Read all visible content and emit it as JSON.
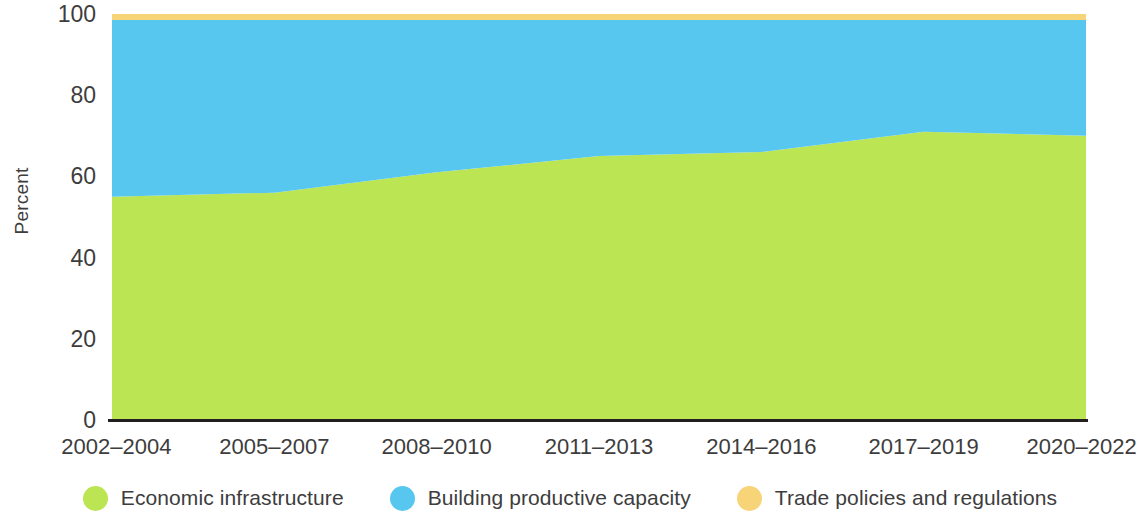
{
  "chart_data": {
    "type": "area",
    "stacked": true,
    "normalized_percent": true,
    "title": "",
    "subtitle": "",
    "xlabel": "",
    "ylabel": "Percent",
    "ylim": [
      0,
      100
    ],
    "yticks": [
      0,
      20,
      40,
      60,
      80,
      100
    ],
    "grid": false,
    "legend_position": "bottom",
    "categories": [
      "2002–2004",
      "2005–2007",
      "2008–2010",
      "2011–2013",
      "2014–2016",
      "2017–2019",
      "2020–2022"
    ],
    "series": [
      {
        "name": "Economic infrastructure",
        "color": "#bbe553",
        "values": [
          55,
          56,
          61,
          65,
          66,
          71,
          70
        ]
      },
      {
        "name": "Building productive capacity",
        "color": "#57c7ef",
        "values": [
          43.5,
          42.5,
          37.5,
          33.5,
          32.5,
          27.5,
          28.5
        ]
      },
      {
        "name": "Trade policies and regulations",
        "color": "#f8d478",
        "values": [
          1.5,
          1.5,
          1.5,
          1.5,
          1.5,
          1.5,
          1.5
        ]
      }
    ]
  },
  "axis": {
    "y_title": "Percent",
    "y_tick_labels": [
      "100",
      "80",
      "60",
      "40",
      "20",
      "0"
    ],
    "x_tick_labels": [
      "2002–2004",
      "2005–2007",
      "2008–2010",
      "2011–2013",
      "2014–2016",
      "2017–2019",
      "2020–2022"
    ]
  },
  "legend": {
    "items": [
      {
        "label": "Economic infrastructure",
        "color": "#bbe553"
      },
      {
        "label": "Building productive capacity",
        "color": "#57c7ef"
      },
      {
        "label": "Trade policies and regulations",
        "color": "#f8d478"
      }
    ]
  },
  "colors": {
    "economic_infrastructure": "#bbe553",
    "building_productive_capacity": "#57c7ef",
    "trade_policies_and_regulations": "#f8d478",
    "axis_line": "#231f20",
    "text": "#3d3d3d"
  }
}
